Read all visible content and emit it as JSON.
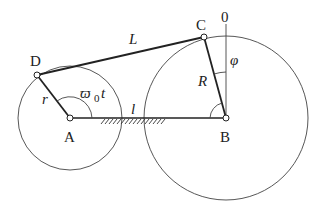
{
  "diagram": {
    "type": "four-bar linkage (crank mechanism)",
    "points": {
      "A": {
        "label": "A",
        "x": 70,
        "y": 118
      },
      "B": {
        "label": "B",
        "x": 226,
        "y": 118
      },
      "C": {
        "label": "C",
        "x": 204,
        "y": 37
      },
      "D": {
        "label": "D",
        "x": 37,
        "y": 75
      },
      "O": {
        "label": "0"
      }
    },
    "links": {
      "r": "r",
      "L": "L",
      "R": "R",
      "l": "l"
    },
    "angles": {
      "crank_angle": "ϖ",
      "crank_angle_sub": "0",
      "crank_angle_t": "t",
      "phi": "φ"
    },
    "circles": [
      {
        "center": "A",
        "radius": 52
      },
      {
        "center": "B",
        "radius": 82
      }
    ]
  }
}
